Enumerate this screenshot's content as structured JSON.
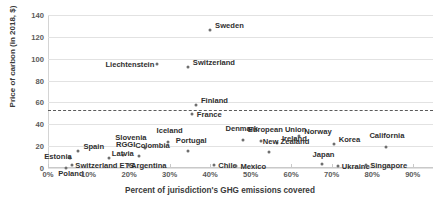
{
  "chart_data": {
    "type": "scatter",
    "title": "",
    "xlabel": "Percent of jurisdiction's GHG emissions covered",
    "ylabel": "Price of carbon (in 2018, $)",
    "xlim": [
      0,
      95
    ],
    "ylim": [
      0,
      140
    ],
    "xticks": [
      "0%",
      "10%",
      "20%",
      "30%",
      "40%",
      "50%",
      "60%",
      "70%",
      "80%",
      "90%"
    ],
    "xtick_values": [
      0,
      10,
      20,
      30,
      40,
      50,
      60,
      70,
      80,
      90
    ],
    "yticks": [
      "0",
      "20",
      "40",
      "60",
      "80",
      "100",
      "120",
      "140"
    ],
    "ytick_values": [
      0,
      20,
      40,
      60,
      80,
      100,
      120,
      140
    ],
    "grid": "horizontal",
    "legend": "none",
    "marker_color": "#6e6e6e",
    "gridline_color": "#e2e2e2",
    "reference_line": {
      "value": 53,
      "style": "dashed",
      "color": "#5a5a5a",
      "label": ""
    },
    "points": [
      {
        "name": "Sweden",
        "x": 40.0,
        "y": 126,
        "lx": 5,
        "ly": -4
      },
      {
        "name": "Switzerland",
        "x": 34.5,
        "y": 92,
        "lx": 5,
        "ly": -4
      },
      {
        "name": "Liechtenstein",
        "x": 27.0,
        "y": 95,
        "lx": -52,
        "ly": 1
      },
      {
        "name": "Finland",
        "x": 36.5,
        "y": 58,
        "lx": 5,
        "ly": -4
      },
      {
        "name": "France",
        "x": 35.5,
        "y": 49,
        "lx": 5,
        "ly": 1
      },
      {
        "name": "Denmark",
        "x": 48.0,
        "y": 26,
        "lx": -17,
        "ly": -11
      },
      {
        "name": "European Union",
        "x": 52.5,
        "y": 25,
        "lx": -13,
        "ly": -11
      },
      {
        "name": "Norway",
        "x": 62.0,
        "y": 29,
        "lx": 5,
        "ly": -4
      },
      {
        "name": "Ireland",
        "x": 56.5,
        "y": 23,
        "lx": 5,
        "ly": -4
      },
      {
        "name": "Korea",
        "x": 70.5,
        "y": 22,
        "lx": 5,
        "ly": -4
      },
      {
        "name": "California",
        "x": 83.5,
        "y": 19,
        "lx": -17,
        "ly": -11
      },
      {
        "name": "Iceland",
        "x": 29.5,
        "y": 24,
        "lx": -11,
        "ly": -11
      },
      {
        "name": "Slovenia",
        "x": 24.0,
        "y": 18,
        "lx": -30,
        "ly": -10
      },
      {
        "name": "Portugal",
        "x": 34.5,
        "y": 16,
        "lx": -12,
        "ly": -10
      },
      {
        "name": "New Zealand",
        "x": 54.5,
        "y": 15,
        "lx": -6,
        "ly": -10
      },
      {
        "name": "Colombia",
        "x": 22.5,
        "y": 11,
        "lx": -4,
        "ly": -10
      },
      {
        "name": "RGGI",
        "x": 18.5,
        "y": 12,
        "lx": -7,
        "ly": -10
      },
      {
        "name": "Latvia",
        "x": 15.0,
        "y": 9,
        "lx": 3,
        "ly": -4
      },
      {
        "name": "Spain",
        "x": 7.5,
        "y": 16,
        "lx": 5,
        "ly": -4
      },
      {
        "name": "Estonia",
        "x": 5.5,
        "y": 9,
        "lx": -26,
        "ly": -1
      },
      {
        "name": "Switzerland ETS",
        "x": 6.0,
        "y": 3,
        "lx": 3,
        "ly": 1
      },
      {
        "name": "Argentina",
        "x": 20.0,
        "y": 3,
        "lx": 2,
        "ly": 1
      },
      {
        "name": "Poland",
        "x": 4.5,
        "y": 0,
        "lx": -8,
        "ly": 6
      },
      {
        "name": "Chile",
        "x": 41.0,
        "y": 3,
        "lx": 4,
        "ly": 1
      },
      {
        "name": "Mexico",
        "x": 46.5,
        "y": 2,
        "lx": 4,
        "ly": 1
      },
      {
        "name": "Japan",
        "x": 67.5,
        "y": 4,
        "lx": -9,
        "ly": -9
      },
      {
        "name": "Ukraine",
        "x": 71.5,
        "y": 2,
        "lx": 4,
        "ly": 1
      },
      {
        "name": "Singapore",
        "x": 78.5,
        "y": 3,
        "lx": 4,
        "ly": 1
      }
    ]
  }
}
